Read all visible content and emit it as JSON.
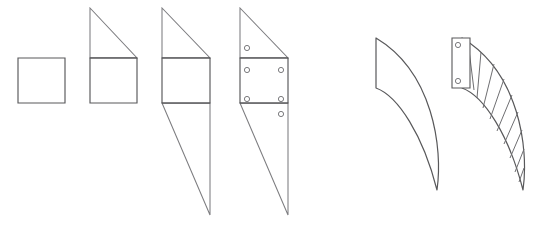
{
  "canvas": {
    "width": 542,
    "height": 229,
    "background_color": "#ffffff",
    "line_color": "#58585a",
    "light_line_color": "#7d7d80",
    "rib_line_color": "#6e6e71",
    "hole_stroke_color": "#6b6b6e"
  },
  "diagram": {
    "title": "",
    "group_count": 2
  },
  "groups": [
    {
      "name": "planar-bracket-progression",
      "label": "",
      "shape_count": 4
    },
    {
      "name": "curved-blade-progression",
      "label": "",
      "shape_count": 2
    }
  ],
  "shapes": [
    {
      "id": "shape-1",
      "name": "square-profile",
      "label": "",
      "type": "square",
      "body_path": "M 18 58 L 65 58 L 65 103 L 18 103 Z",
      "divider_paths": [],
      "upper_triangle_path": "",
      "lower_triangle_path": "",
      "holes": []
    },
    {
      "id": "shape-2",
      "name": "square-with-upper-triangle-profile",
      "label": "",
      "type": "square-plus-upper-wedge",
      "body_path": "M 90 58 L 137 58 L 137 103 L 90 103 Z",
      "upper_triangle_path": "M 90 58 L 90 8 L 137 58 Z",
      "lower_triangle_path": "",
      "divider_paths": [
        "M 90 58 L 137 58"
      ],
      "holes": []
    },
    {
      "id": "shape-3",
      "name": "double-wedge-profile",
      "label": "",
      "type": "square-plus-upper-and-lower-wedge",
      "body_path": "M 162 58 L 210 58 L 210 103 L 162 103 Z",
      "upper_triangle_path": "M 162 58 L 162 8 L 210 58 Z",
      "lower_triangle_path": "M 162 103 L 210 103 L 210 215 Z",
      "divider_paths": [
        "M 162 58 L 210 58",
        "M 162 103 L 210 103"
      ],
      "holes": []
    },
    {
      "id": "shape-4",
      "name": "drilled-double-wedge-profile",
      "label": "",
      "type": "square-plus-wedges-with-holes",
      "body_path": "M 240 58 L 288 58 L 288 103 L 240 103 Z",
      "upper_triangle_path": "M 240 58 L 240 8 L 288 58 Z",
      "lower_triangle_path": "M 240 103 L 288 103 L 288 215 Z",
      "divider_paths": [
        "M 240 58 L 288 58",
        "M 240 103 L 288 103"
      ],
      "hole_count": 6,
      "holes": [
        {
          "name": "hole-upper-left",
          "cx": 247,
          "cy": 48,
          "r": 2.6
        },
        {
          "name": "hole-mid-left",
          "cx": 247,
          "cy": 70,
          "r": 2.6
        },
        {
          "name": "hole-lower-left",
          "cx": 247,
          "cy": 99,
          "r": 2.6
        },
        {
          "name": "hole-mid-right",
          "cx": 281,
          "cy": 70,
          "r": 2.6
        },
        {
          "name": "hole-lower-right",
          "cx": 281,
          "cy": 99,
          "r": 2.6
        },
        {
          "name": "hole-bottom-right",
          "cx": 281,
          "cy": 114,
          "r": 2.6
        }
      ]
    },
    {
      "id": "shape-5",
      "name": "curved-blade-profile",
      "label": "",
      "type": "curved-blade",
      "body_path": "M 376 38 L 376 88 C 398 96 423 135 437 190 C 443 148 433 72 376 38 Z",
      "divider_paths": [],
      "holes": []
    },
    {
      "id": "shape-6",
      "name": "ribbed-curved-blade-profile",
      "label": "",
      "type": "curved-blade-with-ribs",
      "body_path": "M 462 38 L 462 88 C 484 96 509 135 523 190 C 529 148 519 72 462 38 Z",
      "mounting_plate": {
        "name": "mounting-plate",
        "path": "M 452 38 L 470 38 L 470 88 L 452 88 Z",
        "holes": [
          {
            "name": "plate-hole-top",
            "cx": 458,
            "cy": 45,
            "r": 2.6
          },
          {
            "name": "plate-hole-bottom",
            "cx": 458,
            "cy": 81,
            "r": 2.6
          }
        ]
      },
      "rib_count": 9,
      "ribs": [
        {
          "name": "rib-1",
          "path": "M 468 42 L 474 90"
        },
        {
          "name": "rib-2",
          "path": "M 481 52 L 477 98"
        },
        {
          "name": "rib-3",
          "path": "M 494 64 L 483 108"
        },
        {
          "name": "rib-4",
          "path": "M 504 79 L 490 119"
        },
        {
          "name": "rib-5",
          "path": "M 512 95 L 497 131"
        },
        {
          "name": "rib-6",
          "path": "M 518 112 L 504 144"
        },
        {
          "name": "rib-7",
          "path": "M 522 130 L 510 158"
        },
        {
          "name": "rib-8",
          "path": "M 524 149 L 515 172"
        },
        {
          "name": "rib-9",
          "path": "M 524 168 L 519 182"
        }
      ],
      "holes": []
    }
  ]
}
